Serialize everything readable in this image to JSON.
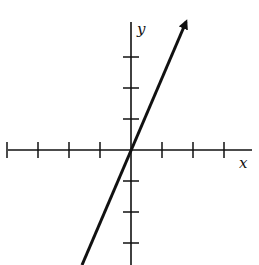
{
  "chart_data": {
    "type": "line",
    "title": "",
    "xlabel": "x",
    "ylabel": "y",
    "grid": false,
    "origin_px": [
      131,
      150
    ],
    "tick_spacing_px": 31,
    "x_ticks": [
      -4,
      -3,
      -2,
      -1,
      1,
      2,
      3
    ],
    "y_ticks": [
      -3,
      -2,
      -1,
      1,
      2,
      3
    ],
    "x_axis_px": {
      "start": 8,
      "end": 252
    },
    "y_axis_px": {
      "top": 22,
      "bottom": 265
    },
    "series": [
      {
        "name": "line",
        "description": "straight line through origin with positive slope, arrow at upper end",
        "slope_approx": 2,
        "points_px": [
          [
            82,
            265
          ],
          [
            131,
            150
          ],
          [
            186,
            22
          ]
        ]
      }
    ]
  },
  "labels": {
    "x": "x",
    "y": "y"
  },
  "top_text_fragment": "y"
}
